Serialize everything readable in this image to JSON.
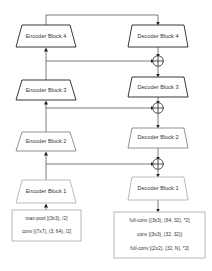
{
  "diagram": {
    "encoder": {
      "blocks": [
        {
          "label": "Encoder Block 4",
          "shade": "dark"
        },
        {
          "label": "Encoder Block 3",
          "shade": "dark"
        },
        {
          "label": "Encoder Block 2",
          "shade": "medium"
        },
        {
          "label": "Encoder Block 1",
          "shade": "light"
        }
      ],
      "stem": {
        "lines": [
          "max-pool [(3x3), /2]",
          "conv [(7x7), (3, 64), /2]"
        ]
      }
    },
    "decoder": {
      "blocks": [
        {
          "label": "Decoder Block 4",
          "shade": "dark"
        },
        {
          "label": "Decoder Block 3",
          "shade": "dark"
        },
        {
          "label": "Decoder Block 2",
          "shade": "medium"
        },
        {
          "label": "Decoder Block 1",
          "shade": "light"
        }
      ],
      "head": {
        "lines": [
          "full-conv [(3x3), (64, 32), *2]",
          "conv [(3x3), (32, 32)]",
          "full-conv [(2x2), (32, N), *2]"
        ]
      }
    },
    "skip_connections": [
      {
        "from": "Encoder Block 3",
        "to": "add-4"
      },
      {
        "from": "Encoder Block 2",
        "to": "add-3"
      },
      {
        "from": "Encoder Block 1",
        "to": "add-2"
      }
    ],
    "add_symbol": "⊕",
    "colors": {
      "dark": "#222222",
      "medium": "#777777",
      "light": "#aaaaaa",
      "line": "#444444",
      "text": "#333333"
    }
  }
}
